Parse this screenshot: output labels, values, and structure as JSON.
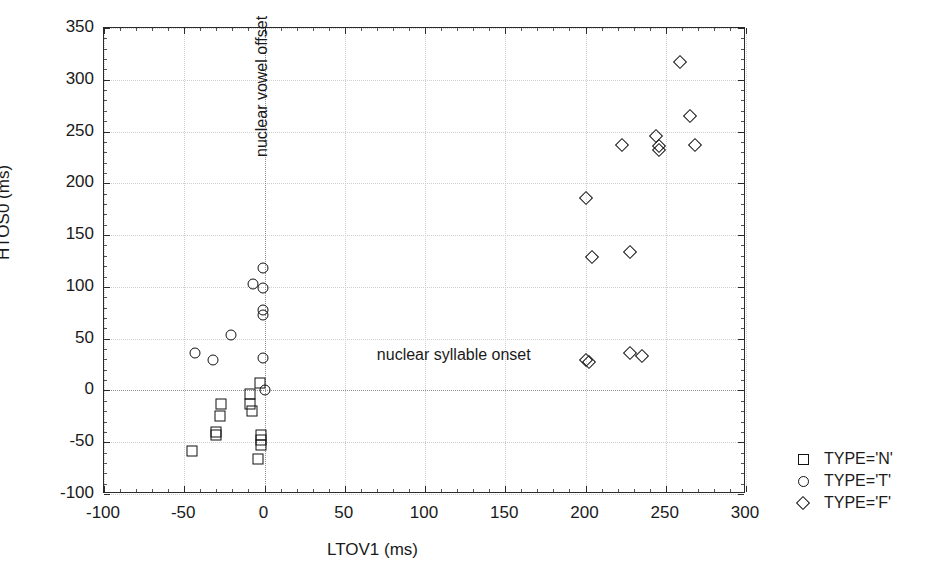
{
  "chart_data": {
    "type": "scatter",
    "title": "",
    "xlabel": "LTOV1 (ms)",
    "ylabel": "HTOS0 (ms)",
    "xlim": [
      -100,
      300
    ],
    "ylim": [
      -100,
      350
    ],
    "xticks": [
      -100,
      -50,
      0,
      50,
      100,
      150,
      200,
      250,
      300
    ],
    "xticklabels": [
      "-100",
      "-50",
      "0",
      "50",
      "100",
      "150",
      "200",
      "250",
      "300"
    ],
    "yticks": [
      -100,
      -50,
      0,
      50,
      100,
      150,
      200,
      250,
      300,
      350
    ],
    "yticklabels": [
      "-100",
      "-50",
      "0",
      "50",
      "100",
      "150",
      "200",
      "250",
      "300",
      "350"
    ],
    "grid": true,
    "grid_style": "dotted",
    "grid_color": "#cfcfcf",
    "marker_color": "#111111",
    "legend_position": "right-outside",
    "reference_lines": [
      {
        "orientation": "vertical",
        "value": 0,
        "label": "nuclear vowel offset"
      },
      {
        "orientation": "horizontal",
        "value": 0,
        "label": "nuclear syllable onset"
      }
    ],
    "annotations": [
      {
        "text": "nuclear vowel offset",
        "x": 0,
        "y": 225,
        "rotation": 90
      },
      {
        "text": "nuclear syllable onset",
        "x": 70,
        "y": 33,
        "rotation": 0
      }
    ],
    "series": [
      {
        "name": "TYPE='N'",
        "marker": "square",
        "points": [
          [
            -45,
            -58
          ],
          [
            -30,
            -40
          ],
          [
            -30,
            -43
          ],
          [
            -28,
            -25
          ],
          [
            -27,
            -13
          ],
          [
            -9,
            -3
          ],
          [
            -9,
            -13
          ],
          [
            -8,
            -20
          ],
          [
            -3,
            7
          ],
          [
            -2,
            -43
          ],
          [
            -2,
            -48
          ],
          [
            -2,
            -53
          ],
          [
            -4,
            -66
          ]
        ]
      },
      {
        "name": "TYPE='T'",
        "marker": "circle",
        "points": [
          [
            -43,
            36
          ],
          [
            -32,
            29
          ],
          [
            -21,
            54
          ],
          [
            -7,
            103
          ],
          [
            -1,
            118
          ],
          [
            -1,
            99
          ],
          [
            -1,
            78
          ],
          [
            -1,
            73
          ],
          [
            -1,
            31
          ],
          [
            0,
            0
          ]
        ]
      },
      {
        "name": "TYPE='F'",
        "marker": "diamond",
        "points": [
          [
            200,
            29
          ],
          [
            202,
            27
          ],
          [
            228,
            36
          ],
          [
            235,
            33
          ],
          [
            200,
            186
          ],
          [
            204,
            129
          ],
          [
            223,
            237
          ],
          [
            228,
            134
          ],
          [
            244,
            246
          ],
          [
            246,
            236
          ],
          [
            246,
            232
          ],
          [
            259,
            317
          ],
          [
            265,
            265
          ],
          [
            268,
            237
          ]
        ]
      }
    ]
  },
  "legend": {
    "entries": [
      {
        "marker": "square",
        "label": "TYPE='N'"
      },
      {
        "marker": "circle",
        "label": "TYPE='T'"
      },
      {
        "marker": "diamond",
        "label": "TYPE='F'"
      }
    ]
  }
}
